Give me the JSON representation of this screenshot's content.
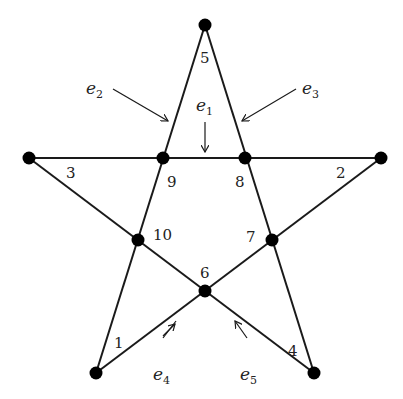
{
  "diagram": {
    "type": "star-graph",
    "nodes": [
      {
        "id": "top",
        "x": 205,
        "y": 25
      },
      {
        "id": "left",
        "x": 29,
        "y": 158
      },
      {
        "id": "right",
        "x": 381,
        "y": 158
      },
      {
        "id": "n9",
        "x": 163,
        "y": 158
      },
      {
        "id": "n8",
        "x": 245,
        "y": 158
      },
      {
        "id": "n10",
        "x": 138,
        "y": 240
      },
      {
        "id": "n7",
        "x": 272,
        "y": 240
      },
      {
        "id": "n6",
        "x": 205,
        "y": 291
      },
      {
        "id": "bl",
        "x": 96,
        "y": 373
      },
      {
        "id": "br",
        "x": 314,
        "y": 373
      }
    ],
    "region_labels": {
      "l1": "1",
      "l2": "2",
      "l3": "3",
      "l4": "4",
      "l5": "5",
      "l6": "6",
      "l7": "7",
      "l8": "8",
      "l9": "9",
      "l10": "10"
    },
    "edge_labels": {
      "e1": {
        "base": "e",
        "sub": "1"
      },
      "e2": {
        "base": "e",
        "sub": "2"
      },
      "e3": {
        "base": "e",
        "sub": "3"
      },
      "e4": {
        "base": "e",
        "sub": "4"
      },
      "e5": {
        "base": "e",
        "sub": "5"
      }
    },
    "colors": {
      "line": "#1a1a1a",
      "node": "#000000"
    }
  }
}
